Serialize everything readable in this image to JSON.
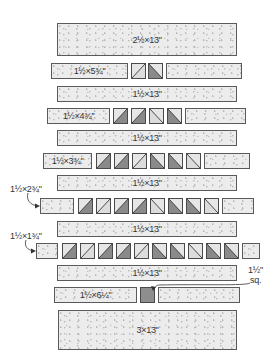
{
  "diagram": {
    "type": "quilt block assembly diagram",
    "colors": {
      "background_fabric": "#ececec",
      "dark_triangle": "#8a8a8a",
      "light_triangle": "#dcdcdc",
      "square_fill": "#8e8e8e",
      "outline": "#4a4a4a"
    },
    "rows": [
      {
        "id": "top",
        "kind": "block",
        "label": "2½×13\""
      },
      {
        "id": "r1",
        "kind": "pieced",
        "left_label": "1½×5¾\"",
        "squares": [
          "light-up",
          "dark-down"
        ]
      },
      {
        "id": "s1",
        "kind": "strip",
        "label": "1½×13\""
      },
      {
        "id": "r2",
        "kind": "pieced",
        "left_label": "1½×4¾\"",
        "squares": [
          "dark-up",
          "dark-up",
          "light-down",
          "dark-down"
        ]
      },
      {
        "id": "s2",
        "kind": "strip",
        "label": "1½×13\""
      },
      {
        "id": "r3",
        "kind": "pieced",
        "left_label": "1½×3¾\"",
        "squares": [
          "dark-up",
          "dark-up",
          "light-up",
          "dark-down",
          "dark-down",
          "light-down"
        ]
      },
      {
        "id": "s3",
        "kind": "strip",
        "label": "1½×13\""
      },
      {
        "id": "r4",
        "kind": "pieced",
        "left_label": "",
        "squares": [
          "dark-up",
          "light-up",
          "dark-up",
          "dark-up",
          "light-down",
          "dark-down",
          "dark-down",
          "light-down"
        ]
      },
      {
        "id": "s4",
        "kind": "strip",
        "label": "1½×13\""
      },
      {
        "id": "r5",
        "kind": "pieced",
        "left_label": "",
        "squares": [
          "dark-up",
          "light-up",
          "dark-up",
          "dark-up",
          "light-up",
          "dark-down",
          "dark-down",
          "light-down",
          "dark-down",
          "dark-down"
        ]
      },
      {
        "id": "s5",
        "kind": "strip",
        "label": "1½×13\""
      },
      {
        "id": "r6",
        "kind": "pieced",
        "left_label": "1½×6¼\"",
        "squares": [
          "solid"
        ]
      },
      {
        "id": "bottom",
        "kind": "block",
        "label": "3×13\""
      }
    ],
    "callouts": {
      "r4": "1½×2¾\"",
      "r5": "1½×1¾\"",
      "square": "1½\"",
      "square_sub": "sq."
    }
  }
}
